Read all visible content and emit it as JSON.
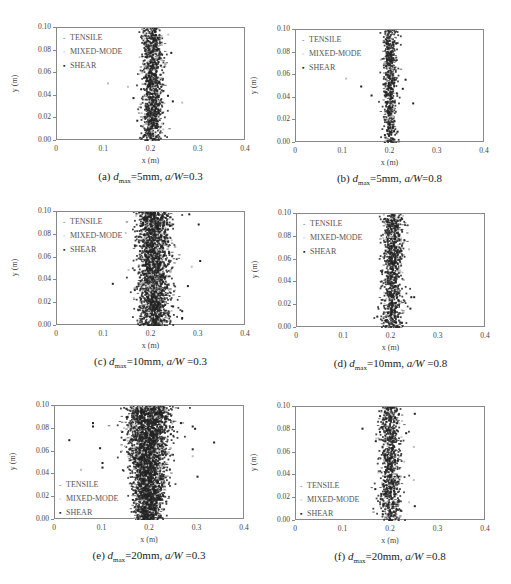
{
  "figure": {
    "legend": [
      "TENSILE",
      "MIXED-MODE",
      "SHEAR"
    ],
    "xlabel": "x (m)",
    "ylabel": "y (m)",
    "xticks": [
      "0",
      "0.1",
      "0.2",
      "0.3",
      "0.4"
    ],
    "yticks": [
      "0.00",
      "0.02",
      "0.04",
      "0.06",
      "0.08",
      "0.10"
    ],
    "colors": {
      "tensile": "#3a3a3a",
      "mixed": "#bdbdbd",
      "shear": "#222222",
      "axis": "#888888"
    }
  },
  "chart_data": [
    {
      "type": "scatter",
      "panel": "a",
      "caption_prefix": "(a)",
      "dmax": "5mm",
      "aW": "0.3",
      "title": "(a) dmax=5mm, a/W=0.3",
      "xlabel": "x (m)",
      "ylabel": "y (m)",
      "xlim": [
        0,
        0.4
      ],
      "ylim": [
        0,
        0.1
      ],
      "series": [
        {
          "name": "TENSILE"
        },
        {
          "name": "MIXED-MODE"
        },
        {
          "name": "SHEAR"
        }
      ],
      "legend_position": "upper-left",
      "cloud": {
        "center_x": 0.202,
        "spread_x": 0.011,
        "count": 1100,
        "widen_bottom": 0.0
      },
      "outliers": [
        [
          0.108,
          0.051,
          "m"
        ],
        [
          0.15,
          0.048,
          "m"
        ],
        [
          0.265,
          0.034,
          "m"
        ],
        [
          0.162,
          0.038,
          "s"
        ],
        [
          0.242,
          0.078,
          "s"
        ],
        [
          0.245,
          0.035,
          "s"
        ],
        [
          0.17,
          0.018,
          "s"
        ],
        [
          0.235,
          0.04,
          "s"
        ]
      ]
    },
    {
      "type": "scatter",
      "panel": "b",
      "caption_prefix": "(b)",
      "dmax": "5mm",
      "aW": "0.8",
      "title": "(b) dmax=5mm, a/W=0.8",
      "xlabel": "x (m)",
      "ylabel": "y (m)",
      "xlim": [
        0,
        0.4
      ],
      "ylim": [
        0,
        0.1
      ],
      "series": [
        {
          "name": "TENSILE"
        },
        {
          "name": "MIXED-MODE"
        },
        {
          "name": "SHEAR"
        }
      ],
      "legend_position": "upper-left",
      "cloud": {
        "center_x": 0.199,
        "spread_x": 0.007,
        "count": 650,
        "widen_bottom": 0.0
      },
      "outliers": [
        [
          0.106,
          0.057,
          "m"
        ],
        [
          0.138,
          0.05,
          "s"
        ],
        [
          0.16,
          0.042,
          "s"
        ],
        [
          0.232,
          0.056,
          "s"
        ],
        [
          0.226,
          0.048,
          "s"
        ],
        [
          0.248,
          0.035,
          "s"
        ],
        [
          0.212,
          0.088,
          "s"
        ],
        [
          0.215,
          0.01,
          "s"
        ]
      ]
    },
    {
      "type": "scatter",
      "panel": "c",
      "caption_prefix": "(c)",
      "dmax": "10mm",
      "aW": "0.3",
      "title": "(c) dmax=10mm, a/W =0.3",
      "xlabel": "x (m)",
      "ylabel": "y (m)",
      "xlim": [
        0,
        0.4
      ],
      "ylim": [
        0,
        0.1
      ],
      "series": [
        {
          "name": "TENSILE"
        },
        {
          "name": "MIXED-MODE"
        },
        {
          "name": "SHEAR"
        }
      ],
      "legend_position": "upper-left",
      "cloud": {
        "center_x": 0.205,
        "spread_x": 0.017,
        "count": 2200,
        "widen_bottom": 0.0
      },
      "outliers": [
        [
          0.118,
          0.037,
          "s"
        ],
        [
          0.28,
          0.098,
          "s"
        ],
        [
          0.3,
          0.089,
          "s"
        ],
        [
          0.303,
          0.057,
          "s"
        ],
        [
          0.285,
          0.052,
          "m"
        ],
        [
          0.277,
          0.035,
          "s"
        ],
        [
          0.265,
          0.007,
          "s"
        ],
        [
          0.265,
          0.013,
          "s"
        ],
        [
          0.175,
          0.0,
          "s"
        ]
      ]
    },
    {
      "type": "scatter",
      "panel": "d",
      "caption_prefix": "(d)",
      "dmax": "10mm",
      "aW": "0.8",
      "title": "(d) dmax=10mm, a/W =0.8",
      "xlabel": "x (m)",
      "ylabel": "y (m)",
      "xlim": [
        0,
        0.4
      ],
      "ylim": [
        0,
        0.1
      ],
      "series": [
        {
          "name": "TENSILE"
        },
        {
          "name": "MIXED-MODE"
        },
        {
          "name": "SHEAR"
        }
      ],
      "legend_position": "upper-left",
      "cloud": {
        "center_x": 0.203,
        "spread_x": 0.011,
        "count": 1000,
        "widen_bottom": 0.0
      },
      "outliers": [
        [
          0.248,
          0.027,
          "s"
        ],
        [
          0.242,
          0.027,
          "s"
        ],
        [
          0.237,
          0.069,
          "m"
        ],
        [
          0.17,
          0.01,
          "s"
        ],
        [
          0.24,
          0.017,
          "s"
        ]
      ]
    },
    {
      "type": "scatter",
      "panel": "e",
      "caption_prefix": "(e)",
      "dmax": "20mm",
      "aW": "0.3",
      "title": "(e) dmax=20mm, a/W =0.3",
      "xlabel": "x (m)",
      "ylabel": "y (m)",
      "xlim": [
        0,
        0.4
      ],
      "ylim": [
        0,
        0.1
      ],
      "series": [
        {
          "name": "TENSILE"
        },
        {
          "name": "MIXED-MODE"
        },
        {
          "name": "SHEAR"
        }
      ],
      "legend_position": "lower-left",
      "cloud": {
        "center_x": 0.197,
        "spread_x": 0.025,
        "count": 3200,
        "widen_bottom": -0.6
      },
      "outliers": [
        [
          0.03,
          0.07,
          "s"
        ],
        [
          0.055,
          0.044,
          "m"
        ],
        [
          0.08,
          0.085,
          "s"
        ],
        [
          0.08,
          0.082,
          "s"
        ],
        [
          0.095,
          0.063,
          "s"
        ],
        [
          0.1,
          0.05,
          "s"
        ],
        [
          0.1,
          0.046,
          "s"
        ],
        [
          0.335,
          0.068,
          "s"
        ],
        [
          0.3,
          0.038,
          "s"
        ],
        [
          0.29,
          0.082,
          "s"
        ],
        [
          0.295,
          0.08,
          "s"
        ],
        [
          0.29,
          0.062,
          "s"
        ],
        [
          0.29,
          0.056,
          "m"
        ],
        [
          0.265,
          0.085,
          "s"
        ]
      ]
    },
    {
      "type": "scatter",
      "panel": "f",
      "caption_prefix": "(f)",
      "dmax": "20mm",
      "aW": "0.8",
      "title": "(f) dmax=20mm, a/W =0.8",
      "xlabel": "x (m)",
      "ylabel": "y (m)",
      "xlim": [
        0,
        0.4
      ],
      "ylim": [
        0,
        0.1
      ],
      "series": [
        {
          "name": "TENSILE"
        },
        {
          "name": "MIXED-MODE"
        },
        {
          "name": "SHEAR"
        }
      ],
      "legend_position": "lower-left",
      "cloud": {
        "center_x": 0.199,
        "spread_x": 0.011,
        "count": 900,
        "widen_bottom": 0.0
      },
      "outliers": [
        [
          0.14,
          0.081,
          "s"
        ],
        [
          0.168,
          0.07,
          "s"
        ],
        [
          0.167,
          0.028,
          "s"
        ],
        [
          0.25,
          0.094,
          "s"
        ],
        [
          0.248,
          0.065,
          "m"
        ],
        [
          0.248,
          0.036,
          "m"
        ],
        [
          0.25,
          0.013,
          "s"
        ],
        [
          0.232,
          0.077,
          "s"
        ]
      ]
    }
  ],
  "panels_layout": [
    {
      "left": 56,
      "top": 27,
      "width": 189,
      "height": 113
    },
    {
      "left": 295,
      "top": 29,
      "width": 189,
      "height": 113
    },
    {
      "left": 56,
      "top": 211,
      "width": 189,
      "height": 114
    },
    {
      "left": 296,
      "top": 213,
      "width": 189,
      "height": 114
    },
    {
      "left": 54,
      "top": 405,
      "width": 190,
      "height": 114
    },
    {
      "left": 295,
      "top": 406,
      "width": 190,
      "height": 114
    }
  ]
}
